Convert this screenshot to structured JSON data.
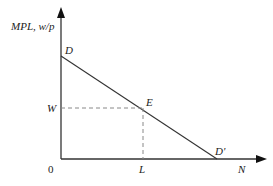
{
  "diagram": {
    "y_axis_label": "MPL, w/p",
    "x_axis_label": "N",
    "origin_label": "0",
    "points": {
      "D": "D",
      "E": "E",
      "D_prime": "D'"
    },
    "tick_labels": {
      "W": "W",
      "L": "L"
    },
    "colors": {
      "line": "#333333",
      "dashed": "#888888"
    }
  }
}
